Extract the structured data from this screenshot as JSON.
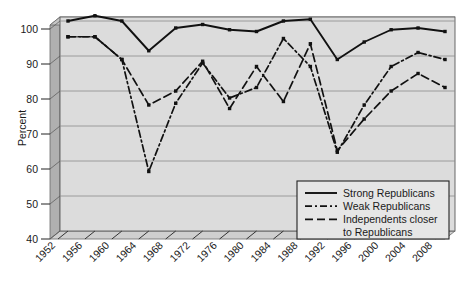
{
  "chart_data": {
    "type": "line",
    "title": "",
    "xlabel": "",
    "ylabel": "Percent",
    "ylim": [
      40,
      100
    ],
    "yticks": [
      40,
      50,
      60,
      70,
      80,
      90,
      100
    ],
    "grid": true,
    "legend_position": "bottom-right",
    "categories": [
      1952,
      1956,
      1960,
      1964,
      1968,
      1972,
      1976,
      1980,
      1984,
      1988,
      1992,
      1996,
      2000,
      2004,
      2008
    ],
    "x": [
      "1952",
      "1956",
      "1960",
      "1964",
      "1968",
      "1972",
      "1976",
      "1980",
      "1984",
      "1988",
      "1992",
      "1996",
      "2000",
      "2004",
      "2008"
    ],
    "series": [
      {
        "name": "Strong Republicans",
        "style": "solid",
        "color": "#111111",
        "values": [
          100,
          101.5,
          100,
          91.5,
          98,
          99,
          97.5,
          97,
          100,
          100.5,
          89,
          94,
          97.5,
          98,
          97
        ]
      },
      {
        "name": "Weak Republicans",
        "style": "dash-dot",
        "color": "#111111",
        "values": [
          95.5,
          95.5,
          89,
          57,
          76.5,
          88,
          78,
          81,
          95,
          87,
          62.5,
          76,
          87,
          91,
          89
        ]
      },
      {
        "name": "Independents closer to Republicans",
        "style": "dashed",
        "color": "#111111",
        "values": [
          95.5,
          95.5,
          89,
          76,
          80,
          88.5,
          75,
          87,
          77,
          93.5,
          63,
          72,
          80,
          85,
          81
        ]
      }
    ]
  },
  "legend": {
    "items": [
      {
        "label": "Strong Republicans",
        "style": "solid"
      },
      {
        "label": "Weak Republicans",
        "style": "dash-dot"
      },
      {
        "label": "Independents closer",
        "style": "dashed"
      },
      {
        "label": "to Republicans",
        "style": "none"
      }
    ]
  },
  "axes": {
    "y_title": "Percent",
    "y_labels": [
      "100",
      "90",
      "80",
      "70",
      "60",
      "50",
      "40"
    ],
    "x_labels": [
      "1952",
      "1956",
      "1960",
      "1964",
      "1968",
      "1972",
      "1976",
      "1980",
      "1984",
      "1988",
      "1992",
      "1996",
      "2000",
      "2004",
      "2008"
    ]
  },
  "colors": {
    "plot_background": "#dcdcdc",
    "panel_side": "#b4b4b4",
    "panel_top": "#c8c8c8",
    "gridline": "#8c8c8c",
    "line": "#111111",
    "page_background": "#ffffff",
    "legend_background": "#e4e4e4",
    "legend_border": "#2a2a2a"
  }
}
